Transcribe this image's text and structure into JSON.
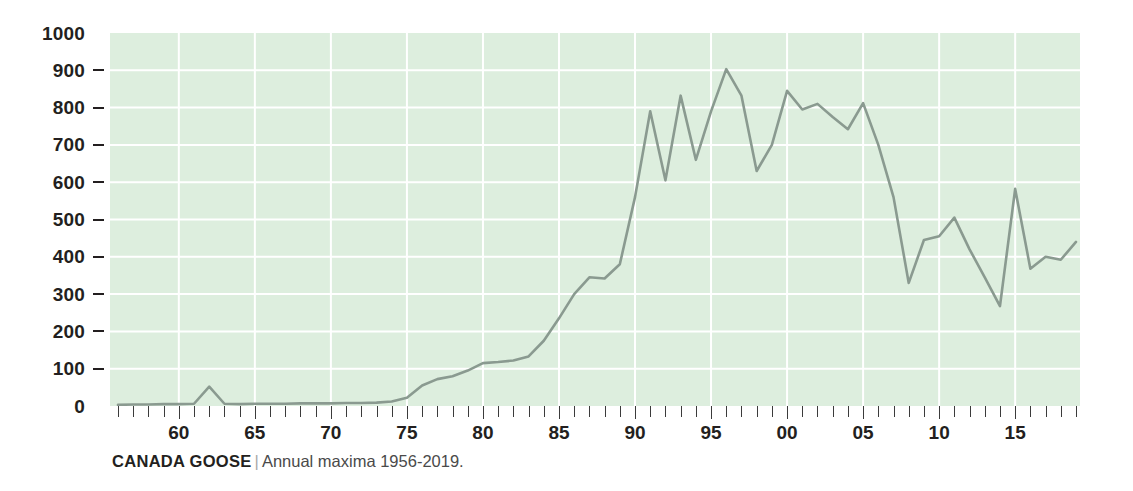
{
  "caption": {
    "species": "CANADA GOOSE",
    "separator": "|",
    "description": "Annual maxima 1956-2019."
  },
  "colors": {
    "plot_background": "#ddeede",
    "gridline": "#ffffff",
    "line": "#8a9a90",
    "text": "#231f20",
    "caption_muted": "#a8a8a8"
  },
  "chart_data": {
    "type": "line",
    "title": "CANADA GOOSE",
    "subtitle": "Annual maxima 1956-2019.",
    "xlabel": "",
    "ylabel": "",
    "grid": true,
    "legend": "none",
    "xlim": [
      1956,
      2019
    ],
    "ylim": [
      0,
      1000
    ],
    "y_ticks": [
      0,
      100,
      200,
      300,
      400,
      500,
      600,
      700,
      800,
      900,
      1000
    ],
    "y_tick_labels": [
      "0",
      "100",
      "200",
      "300",
      "400",
      "500",
      "600",
      "700",
      "800",
      "900",
      "1000"
    ],
    "x_ticks": [
      1960,
      1965,
      1970,
      1975,
      1980,
      1985,
      1990,
      1995,
      2000,
      2005,
      2010,
      2015
    ],
    "x_tick_labels": [
      "60",
      "65",
      "70",
      "75",
      "80",
      "85",
      "90",
      "95",
      "00",
      "05",
      "10",
      "15"
    ],
    "x_minor_tick_interval": 1,
    "x": [
      1956,
      1957,
      1958,
      1959,
      1960,
      1961,
      1962,
      1963,
      1964,
      1965,
      1966,
      1967,
      1968,
      1969,
      1970,
      1971,
      1972,
      1973,
      1974,
      1975,
      1976,
      1977,
      1978,
      1979,
      1980,
      1981,
      1982,
      1983,
      1984,
      1985,
      1986,
      1987,
      1988,
      1989,
      1990,
      1991,
      1992,
      1993,
      1994,
      1995,
      1996,
      1997,
      1998,
      1999,
      2000,
      2001,
      2002,
      2003,
      2004,
      2005,
      2006,
      2007,
      2008,
      2009,
      2010,
      2011,
      2012,
      2013,
      2014,
      2015,
      2016,
      2017,
      2018,
      2019
    ],
    "series": [
      {
        "name": "Annual maxima",
        "color": "#8a9a90",
        "values": [
          3,
          4,
          4,
          5,
          5,
          6,
          52,
          6,
          5,
          6,
          6,
          6,
          7,
          7,
          7,
          8,
          8,
          9,
          12,
          22,
          55,
          72,
          80,
          95,
          115,
          118,
          122,
          133,
          175,
          235,
          300,
          345,
          342,
          380,
          560,
          790,
          605,
          832,
          660,
          790,
          903,
          832,
          630,
          700,
          845,
          795,
          810,
          775,
          742,
          812,
          700,
          560,
          330,
          445,
          455,
          505,
          420,
          345,
          268,
          582,
          368,
          400,
          392,
          440
        ]
      }
    ]
  }
}
